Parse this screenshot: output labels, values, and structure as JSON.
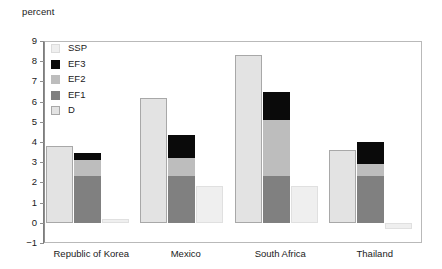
{
  "chart_data": {
    "type": "bar",
    "subtype": "grouped-stacked",
    "title": "",
    "ylabel": "percent",
    "xlabel": "",
    "ylim": [
      -1,
      9
    ],
    "yticks": [
      -1,
      0,
      1,
      2,
      3,
      4,
      5,
      6,
      7,
      8,
      9
    ],
    "ytick_labels": [
      "−1",
      "0",
      "1",
      "2",
      "3",
      "4",
      "5",
      "6",
      "7",
      "8",
      "9"
    ],
    "grid": false,
    "legend_position": "inside-top-left",
    "categories": [
      "Republic of Korea",
      "Mexico",
      "South Africa",
      "Thailand"
    ],
    "series": [
      {
        "name": "D",
        "stack": "d",
        "color": "#e3e3e3",
        "border": "#a8a8a8",
        "values": [
          3.8,
          6.2,
          8.3,
          3.6
        ]
      },
      {
        "name": "EF1",
        "stack": "ef",
        "color": "#808080",
        "border": "#808080",
        "values": [
          2.3,
          2.3,
          2.3,
          2.3
        ]
      },
      {
        "name": "EF2",
        "stack": "ef",
        "color": "#bdbdbd",
        "border": "#bdbdbd",
        "values": [
          0.8,
          0.9,
          2.8,
          0.6
        ]
      },
      {
        "name": "EF3",
        "stack": "ef",
        "color": "#0a0a0a",
        "border": "#0a0a0a",
        "values": [
          0.35,
          1.15,
          1.4,
          1.1
        ]
      },
      {
        "name": "SSP",
        "stack": "ssp",
        "color": "#efefef",
        "border": "#e0e0e0",
        "values": [
          0.2,
          1.8,
          1.8,
          -0.3
        ]
      }
    ],
    "stack_totals": {
      "D": [
        3.8,
        6.2,
        8.3,
        3.6
      ],
      "EF": [
        3.45,
        4.35,
        6.5,
        4.0
      ],
      "SSP": [
        0.2,
        1.8,
        1.8,
        -0.3
      ]
    }
  },
  "legend": {
    "items": [
      {
        "label": "SSP",
        "swatch": "ssp-swatch"
      },
      {
        "label": "EF3",
        "swatch": "ef3-swatch"
      },
      {
        "label": "EF2",
        "swatch": "ef2-swatch"
      },
      {
        "label": "EF1",
        "swatch": "ef1-swatch"
      },
      {
        "label": "D",
        "swatch": "d-swatch"
      }
    ]
  },
  "colors": {
    "ssp": "#efefef",
    "ssp_border": "#dcdcdc",
    "ef3": "#0a0a0a",
    "ef2": "#bdbdbd",
    "ef1": "#808080",
    "d": "#e3e3e3",
    "d_border": "#a8a8a8",
    "axis": "#8f8f8f",
    "frame": "#b9b9b9",
    "text": "#1a1a1a"
  }
}
